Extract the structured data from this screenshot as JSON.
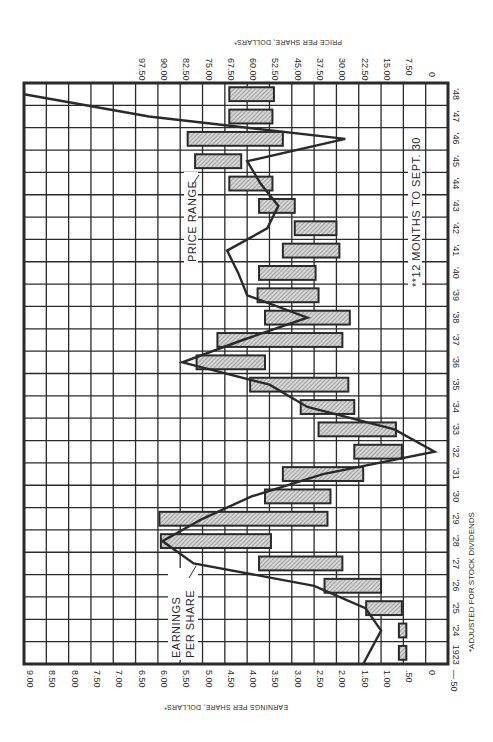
{
  "chart_data": {
    "type": "bar",
    "orientation": "rotated-90-horizontal-range-bars-with-line",
    "title": "",
    "left_axis_title": "Earnings Per Share, Dollars*",
    "right_axis_title": "Price Per Share, Dollars*",
    "year_axis_labels": [
      "1923",
      "'24",
      "'25",
      "'26",
      "'27",
      "'28",
      "'29",
      "'30",
      "'31",
      "'32",
      "'33",
      "'34",
      "'35",
      "'36",
      "'37",
      "'38",
      "'39",
      "'40",
      "'41",
      "'42",
      "'43",
      "'44",
      "'45",
      "'46",
      "'47",
      "'48"
    ],
    "earnings_ticks": [
      "9.00",
      "8.50",
      "8.00",
      "7.50",
      "7.00",
      "6.50",
      "6.00",
      "5.50",
      "5.00",
      "4.50",
      "4.00",
      "3.50",
      "3.00",
      "2.50",
      "2.00",
      "1.50",
      "1.00",
      ".50",
      "0",
      "—.50"
    ],
    "price_ticks": [
      "97.50",
      "90.00",
      "82.50",
      "75.00",
      "67.50",
      "60.00",
      "52.50",
      "45.00",
      "37.50",
      "30.00",
      "22.50",
      "15.00",
      "7.50",
      "0"
    ],
    "earnings_range": [
      -0.5,
      9.0
    ],
    "price_range": [
      0,
      97.5
    ],
    "grid": true,
    "series": [
      {
        "name": "Price Range",
        "kind": "range-bar",
        "years": [
          1923,
          1924,
          1925,
          1926,
          1927,
          1928,
          1929,
          1930,
          1931,
          1932,
          1933,
          1934,
          1935,
          1936,
          1937,
          1938,
          1939,
          1940,
          1941,
          1942,
          1943,
          1944,
          1945,
          1946,
          1947,
          1948
        ],
        "low": [
          6.5,
          6.5,
          8,
          15,
          28,
          52,
          33,
          32,
          21,
          8,
          10,
          24,
          26,
          54,
          28,
          25.5,
          36,
          37,
          29,
          30,
          44,
          51.5,
          62,
          48,
          51.5,
          51
        ],
        "high": [
          9,
          9,
          20,
          34,
          56,
          89,
          89.5,
          54,
          48,
          24,
          36,
          42,
          59,
          77,
          70,
          54,
          56.5,
          56,
          48,
          44,
          56,
          66,
          77.5,
          80,
          66,
          66
        ]
      },
      {
        "name": "Earnings Per Share",
        "kind": "line",
        "years": [
          1923,
          1924,
          1925,
          1926,
          1927,
          1928,
          1929,
          1930,
          1931,
          1932,
          1933,
          1934,
          1935,
          1936,
          1937,
          1938,
          1939,
          1940,
          1941,
          1942,
          1943,
          1944,
          1945,
          1946,
          1947,
          1948
        ],
        "values": [
          1.4,
          1.0,
          1.35,
          2.5,
          5.2,
          5.9,
          5.0,
          3.9,
          2.3,
          -0.2,
          0.7,
          2.65,
          3.5,
          5.45,
          4.1,
          2.65,
          4.0,
          4.2,
          4.45,
          3.55,
          3.3,
          3.7,
          4.0,
          1.8,
          6.2,
          9.1
        ]
      }
    ],
    "annotations": [
      {
        "text": "Earnings",
        "text2": "Per Share",
        "points_to": "Earnings Per Share line"
      },
      {
        "text": "Price Range",
        "points_to": "Price Range bars"
      },
      {
        "text": "**12 Months to Sept. 30",
        "applies_to": "1948"
      }
    ],
    "footnote": "*Adjusted for Stock Dividends"
  },
  "labels": {
    "earnings_label_1": "EARNINGS",
    "earnings_label_2": "PER SHARE",
    "price_range_label": "PRICE RANGE",
    "months_note": "**12 MONTHS TO SEPT. 30",
    "footnote": "*ADJUSTED FOR STOCK DIVIDENDS",
    "left_axis_title": "EARNINGS PER SHARE, DOLLARS*",
    "right_axis_title": "PRICE PER SHARE, DOLLARS*"
  },
  "colors": {
    "ink": "#2a2a2a",
    "bar_fill": "#bdbdbd",
    "background": "#ffffff"
  }
}
